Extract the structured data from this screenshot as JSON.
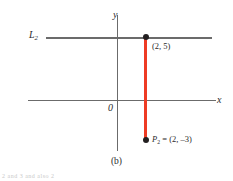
{
  "figure": {
    "caption": "(b)",
    "bottom_fragment": "2 and 3 and also 2",
    "axes": {
      "x_label": "x",
      "y_label": "y",
      "origin_label": "0"
    },
    "line": {
      "name": "L",
      "subscript": "2"
    },
    "points": [
      {
        "id": "top",
        "label": "(2, 5)",
        "x": 2,
        "y": 5
      },
      {
        "id": "bottom",
        "point_name": "P",
        "point_subscript": "2",
        "equals": " = ",
        "label": "(2, –3)",
        "x": 2,
        "y": -3
      }
    ],
    "colors": {
      "segment": "#ee3b24",
      "axis": "#6b6b6b",
      "dot": "#231f20",
      "background": "#ffffff"
    }
  }
}
